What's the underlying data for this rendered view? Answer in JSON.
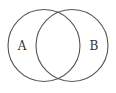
{
  "diagram": {
    "type": "venn",
    "stroke_color": "#555555",
    "label_color": "#333333",
    "background": "#ffffff",
    "sets": [
      {
        "id": "A",
        "label": "A",
        "cx": 44,
        "cy": 45.5,
        "r": 36,
        "label_x": 22,
        "label_y": 50
      },
      {
        "id": "B",
        "label": "B",
        "cx": 72,
        "cy": 45.5,
        "r": 36,
        "label_x": 94,
        "label_y": 50
      }
    ]
  }
}
